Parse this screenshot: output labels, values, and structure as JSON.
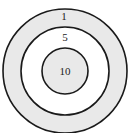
{
  "diagram": {
    "type": "target",
    "rings": [
      {
        "name": "outer",
        "label": "1",
        "fill": "#e9e9e9"
      },
      {
        "name": "middle",
        "label": "5",
        "fill": "#ffffff"
      },
      {
        "name": "inner",
        "label": "10",
        "fill": "#e9e9e9"
      }
    ],
    "stroke": "#1a1a1a"
  }
}
